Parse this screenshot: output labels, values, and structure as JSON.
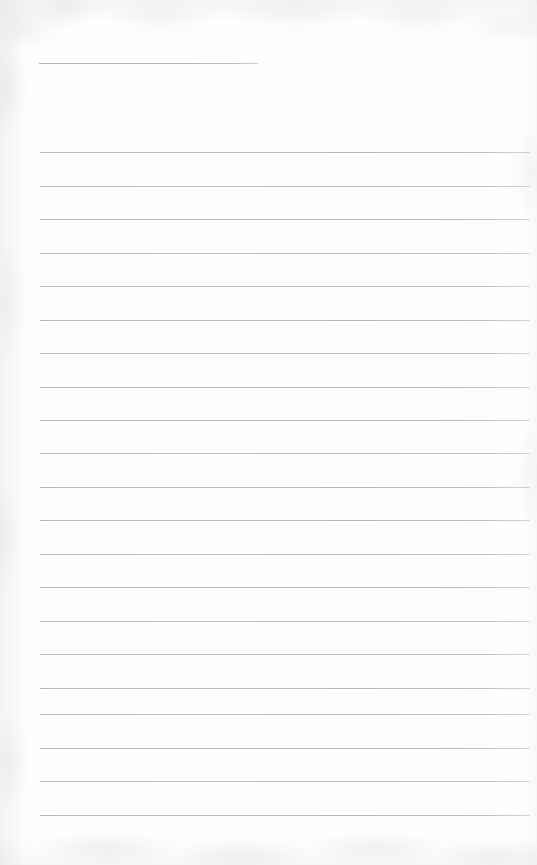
{
  "document": {
    "kind": "blank-ruled-notebook-page",
    "title": "",
    "body_text": "",
    "page_width": 537,
    "page_height": 865,
    "background_color": "#fefefe",
    "rule_color": "#b4b4ba",
    "rule_thickness_px": 1,
    "rule_spacing_px": 33.5,
    "notes": ""
  },
  "rules": [
    {
      "name": "title-rule",
      "y": 63,
      "x_start": 39,
      "x_end": 258,
      "variant": "title"
    },
    {
      "name": "rule-1",
      "y": 152,
      "x_start": 40,
      "x_end": 530,
      "variant": "body"
    },
    {
      "name": "rule-2",
      "y": 186,
      "x_start": 40,
      "x_end": 530,
      "variant": "body"
    },
    {
      "name": "rule-3",
      "y": 219,
      "x_start": 40,
      "x_end": 530,
      "variant": "body"
    },
    {
      "name": "rule-4",
      "y": 253,
      "x_start": 40,
      "x_end": 530,
      "variant": "body"
    },
    {
      "name": "rule-5",
      "y": 286,
      "x_start": 40,
      "x_end": 530,
      "variant": "body"
    },
    {
      "name": "rule-6",
      "y": 320,
      "x_start": 40,
      "x_end": 530,
      "variant": "body"
    },
    {
      "name": "rule-7",
      "y": 353,
      "x_start": 40,
      "x_end": 530,
      "variant": "body"
    },
    {
      "name": "rule-8",
      "y": 387,
      "x_start": 40,
      "x_end": 530,
      "variant": "body"
    },
    {
      "name": "rule-9",
      "y": 420,
      "x_start": 40,
      "x_end": 530,
      "variant": "body"
    },
    {
      "name": "rule-10",
      "y": 453,
      "x_start": 40,
      "x_end": 530,
      "variant": "body"
    },
    {
      "name": "rule-11",
      "y": 487,
      "x_start": 40,
      "x_end": 530,
      "variant": "body"
    },
    {
      "name": "rule-12",
      "y": 520,
      "x_start": 40,
      "x_end": 530,
      "variant": "body"
    },
    {
      "name": "rule-13",
      "y": 554,
      "x_start": 40,
      "x_end": 530,
      "variant": "body"
    },
    {
      "name": "rule-14",
      "y": 587,
      "x_start": 40,
      "x_end": 530,
      "variant": "body"
    },
    {
      "name": "rule-15",
      "y": 621,
      "x_start": 40,
      "x_end": 530,
      "variant": "body"
    },
    {
      "name": "rule-16",
      "y": 654,
      "x_start": 40,
      "x_end": 530,
      "variant": "body"
    },
    {
      "name": "rule-17",
      "y": 688,
      "x_start": 40,
      "x_end": 530,
      "variant": "body"
    },
    {
      "name": "rule-18",
      "y": 714,
      "x_start": 40,
      "x_end": 530,
      "variant": "body"
    },
    {
      "name": "rule-19",
      "y": 748,
      "x_start": 40,
      "x_end": 530,
      "variant": "body"
    },
    {
      "name": "rule-20",
      "y": 781,
      "x_start": 40,
      "x_end": 530,
      "variant": "body"
    },
    {
      "name": "rule-21",
      "y": 815,
      "x_start": 40,
      "x_end": 530,
      "variant": "body"
    }
  ]
}
